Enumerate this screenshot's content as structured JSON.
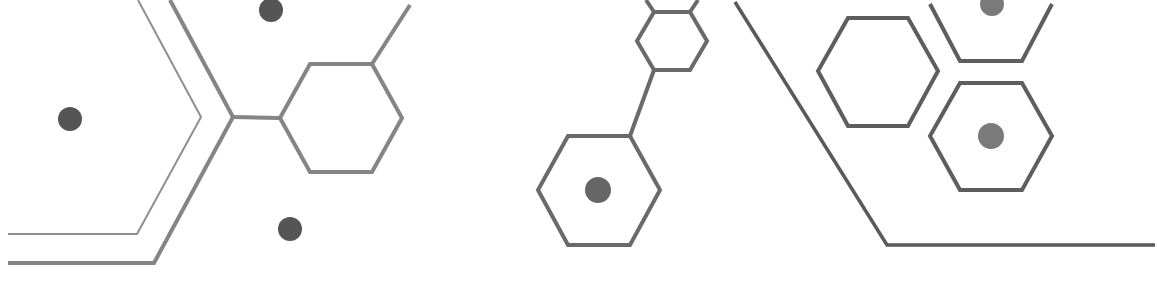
{
  "graphic": {
    "background": "#ffffff",
    "colors": {
      "line_light": "#8a8a8a",
      "line_mid": "#7a7a7a",
      "line_dark": "#5e5e5e",
      "dot_dark": "#555555",
      "dot_mid": "#7a7a7a"
    },
    "elements": [
      "thin-chevron-line",
      "thick-chevron-line",
      "hexagon-left",
      "hexagon-small-top",
      "hexagon-bottom-center",
      "hexagon-right-upper",
      "hexagon-right-top",
      "hexagon-right-lower",
      "diagonal-floor-line",
      "dot-left",
      "dot-top",
      "dot-bottom",
      "dot-hex-center",
      "dot-right-top",
      "dot-right-lower"
    ]
  }
}
